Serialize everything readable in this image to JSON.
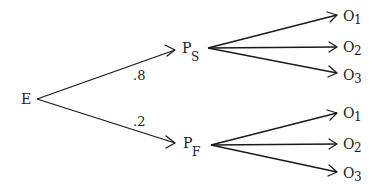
{
  "diagram": {
    "type": "probability-tree",
    "root": {
      "id": "E",
      "label": "E"
    },
    "nodes": [
      {
        "id": "PS",
        "label": "P",
        "subscript": "S"
      },
      {
        "id": "PF",
        "label": "P",
        "subscript": "F"
      }
    ],
    "edges_root": [
      {
        "from": "E",
        "to": "PS",
        "probability": ".8"
      },
      {
        "from": "E",
        "to": "PF",
        "probability": ".2"
      }
    ],
    "outcomes": {
      "PS": [
        {
          "label": "O",
          "subscript": "1"
        },
        {
          "label": "O",
          "subscript": "2"
        },
        {
          "label": "O",
          "subscript": "3"
        }
      ],
      "PF": [
        {
          "label": "O",
          "subscript": "1"
        },
        {
          "label": "O",
          "subscript": "2"
        },
        {
          "label": "O",
          "subscript": "3"
        }
      ]
    }
  }
}
